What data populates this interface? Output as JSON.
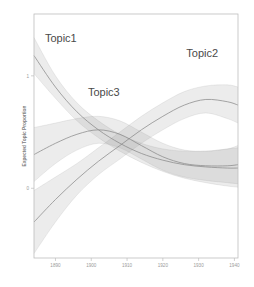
{
  "figure": {
    "background_color": "#ffffff",
    "frame_color": "#b9b9b9",
    "band_color": "#8c8c8c",
    "line_color": "#8a8a8a",
    "label_color": "#4a4a4a"
  },
  "chart_data": {
    "type": "line",
    "title": "",
    "xlabel": "",
    "ylabel": "Expected Topic Proportion",
    "xlim": [
      1884,
      1941
    ],
    "ylim": [
      -0.62,
      1.55
    ],
    "grid": false,
    "legend": "inline-annotations",
    "xticks": [
      1890,
      1900,
      1910,
      1920,
      1930,
      1940
    ],
    "xtick_labels": [
      "1890",
      "1900",
      "1910",
      "1920",
      "1930",
      "1940"
    ],
    "yticks": [
      0,
      1
    ],
    "ytick_labels": [
      "0",
      "1"
    ],
    "annotations": [
      {
        "text": "Topic1",
        "x": 1891.5,
        "y": 1.3
      },
      {
        "text": "Topic2",
        "x": 1931.0,
        "y": 1.17
      },
      {
        "text": "Topic3",
        "x": 1903.5,
        "y": 0.82
      }
    ],
    "series": [
      {
        "name": "Topic1",
        "x": [
          1884,
          1890,
          1896,
          1902,
          1908,
          1914,
          1920,
          1926,
          1932,
          1938,
          1941
        ],
        "values": [
          1.18,
          0.9,
          0.68,
          0.52,
          0.4,
          0.31,
          0.25,
          0.21,
          0.19,
          0.18,
          0.18
        ],
        "band_lower": [
          1.02,
          0.8,
          0.6,
          0.45,
          0.33,
          0.23,
          0.15,
          0.09,
          0.05,
          0.02,
          0.01
        ],
        "band_upper": [
          1.34,
          1.0,
          0.76,
          0.6,
          0.48,
          0.4,
          0.35,
          0.33,
          0.33,
          0.35,
          0.36
        ]
      },
      {
        "name": "Topic2",
        "x": [
          1884,
          1890,
          1896,
          1902,
          1908,
          1914,
          1920,
          1926,
          1932,
          1938,
          1941
        ],
        "values": [
          -0.3,
          -0.1,
          0.08,
          0.24,
          0.38,
          0.52,
          0.64,
          0.74,
          0.79,
          0.77,
          0.74
        ],
        "band_lower": [
          -0.58,
          -0.3,
          -0.06,
          0.12,
          0.26,
          0.4,
          0.52,
          0.62,
          0.67,
          0.62,
          0.58
        ],
        "band_upper": [
          -0.02,
          0.1,
          0.22,
          0.36,
          0.5,
          0.64,
          0.76,
          0.86,
          0.91,
          0.92,
          0.9
        ]
      },
      {
        "name": "Topic3",
        "x": [
          1884,
          1890,
          1896,
          1902,
          1908,
          1914,
          1920,
          1926,
          1932,
          1938,
          1941
        ],
        "values": [
          0.3,
          0.4,
          0.48,
          0.52,
          0.48,
          0.38,
          0.28,
          0.22,
          0.2,
          0.2,
          0.21
        ],
        "band_lower": [
          0.06,
          0.22,
          0.34,
          0.4,
          0.36,
          0.26,
          0.16,
          0.1,
          0.07,
          0.05,
          0.04
        ],
        "band_upper": [
          0.54,
          0.58,
          0.62,
          0.64,
          0.6,
          0.5,
          0.4,
          0.34,
          0.33,
          0.35,
          0.38
        ]
      }
    ]
  }
}
